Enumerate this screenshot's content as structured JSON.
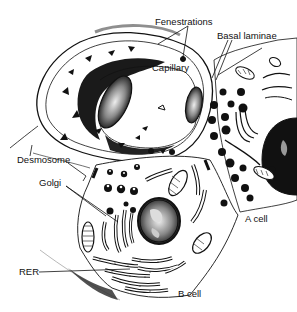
{
  "figure": {
    "colors": {
      "ink": "#111111",
      "background": "#ffffff",
      "shade": "#2a2a2a",
      "light_shade": "#bdbdbd"
    },
    "labels": [
      {
        "id": "fenestrations",
        "text": "Fenestrations",
        "x": 155,
        "y": 17
      },
      {
        "id": "basal-laminae",
        "text": "Basal laminae",
        "x": 217,
        "y": 31
      },
      {
        "id": "capillary",
        "text": "Capillary",
        "x": 152,
        "y": 63
      },
      {
        "id": "desmosome",
        "text": "Desmosome",
        "x": 17,
        "y": 158
      },
      {
        "id": "golgi",
        "text": "Golgi",
        "x": 39,
        "y": 181
      },
      {
        "id": "a-cell",
        "text": "A cell",
        "x": 245,
        "y": 214
      },
      {
        "id": "rer",
        "text": "RER",
        "x": 19,
        "y": 272
      },
      {
        "id": "b-cell",
        "text": "B cell",
        "x": 178,
        "y": 290
      }
    ]
  }
}
